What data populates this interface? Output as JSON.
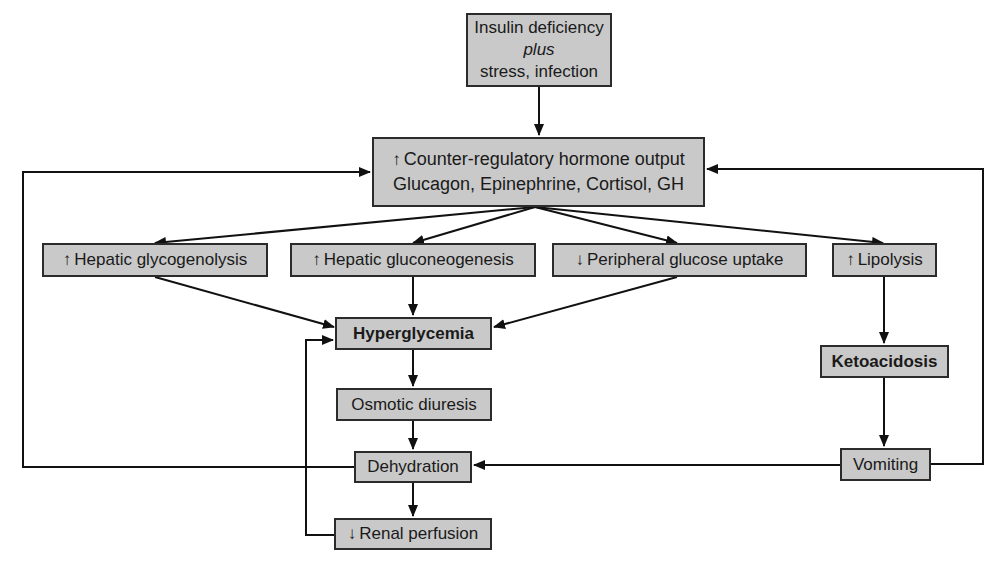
{
  "diagram": {
    "nodes": {
      "trigger": {
        "line1": "Insulin deficiency",
        "line2": "plus",
        "line3": "stress, infection"
      },
      "counter_regulatory": {
        "prefix": "↑",
        "line1": "Counter-regulatory hormone output",
        "line2": "Glucagon, Epinephrine, Cortisol, GH"
      },
      "glycogenolysis": {
        "prefix": "↑",
        "label": "Hepatic glycogenolysis"
      },
      "gluconeogenesis": {
        "prefix": "↑",
        "label": "Hepatic gluconeogenesis"
      },
      "glucose_uptake": {
        "prefix": "↓",
        "label": "Peripheral glucose uptake"
      },
      "lipolysis": {
        "prefix": "↑",
        "label": "Lipolysis"
      },
      "hyperglycemia": {
        "label": "Hyperglycemia"
      },
      "osmotic_diuresis": {
        "label": "Osmotic diuresis"
      },
      "dehydration": {
        "label": "Dehydration"
      },
      "renal_perfusion": {
        "prefix": "↓",
        "label": "Renal perfusion"
      },
      "ketoacidosis": {
        "label": "Ketoacidosis"
      },
      "vomiting": {
        "label": "Vomiting"
      }
    },
    "edges": [
      {
        "from": "trigger",
        "to": "counter_regulatory"
      },
      {
        "from": "counter_regulatory",
        "to": "glycogenolysis"
      },
      {
        "from": "counter_regulatory",
        "to": "gluconeogenesis"
      },
      {
        "from": "counter_regulatory",
        "to": "glucose_uptake"
      },
      {
        "from": "counter_regulatory",
        "to": "lipolysis"
      },
      {
        "from": "glycogenolysis",
        "to": "hyperglycemia"
      },
      {
        "from": "gluconeogenesis",
        "to": "hyperglycemia"
      },
      {
        "from": "glucose_uptake",
        "to": "hyperglycemia"
      },
      {
        "from": "hyperglycemia",
        "to": "osmotic_diuresis"
      },
      {
        "from": "osmotic_diuresis",
        "to": "dehydration"
      },
      {
        "from": "dehydration",
        "to": "renal_perfusion"
      },
      {
        "from": "renal_perfusion",
        "to": "hyperglycemia"
      },
      {
        "from": "dehydration",
        "to": "counter_regulatory"
      },
      {
        "from": "lipolysis",
        "to": "ketoacidosis"
      },
      {
        "from": "ketoacidosis",
        "to": "vomiting"
      },
      {
        "from": "vomiting",
        "to": "dehydration"
      },
      {
        "from": "vomiting",
        "to": "counter_regulatory"
      }
    ],
    "colors": {
      "box_fill": "#c9c9c9",
      "box_border": "#2b2b2b",
      "line": "#111111",
      "background": "#ffffff"
    }
  }
}
